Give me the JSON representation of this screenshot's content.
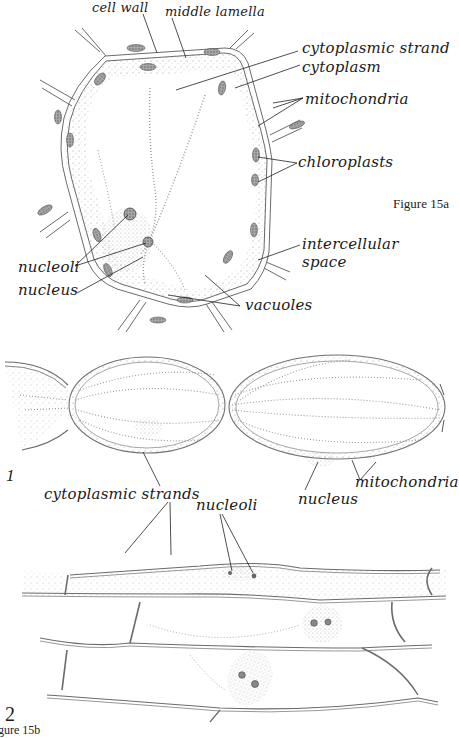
{
  "figure_a": {
    "caption": "Figure 15a",
    "labels": {
      "cell_wall": "cell wall",
      "middle_lamella": "middle lamella",
      "cytoplasmic_strand": "cytoplasmic strand",
      "cytoplasm": "cytoplasm",
      "mitochondria": "mitochondria",
      "chloroplasts": "chloroplasts",
      "intercellular": "intercellular",
      "space": "space",
      "vacuoles": "vacuoles",
      "nucleoli": "nucleoli",
      "nucleus": "nucleus"
    }
  },
  "figure_b": {
    "panel_1": {
      "number": "1",
      "labels": {
        "cytoplasmic_strands": "cytoplasmic strands",
        "mitochondria": "mitochondria",
        "nucleus": "nucleus",
        "nucleoli": "nucleoli"
      }
    },
    "panel_2": {
      "number": "2"
    },
    "caption_partial": "gure 15b"
  },
  "colors": {
    "ink": "#1a1a1a",
    "wall": "#6b6b6b",
    "stipple": "#9a9a9a",
    "chloroplast": "#7d7d7d",
    "background": "#ffffff"
  }
}
